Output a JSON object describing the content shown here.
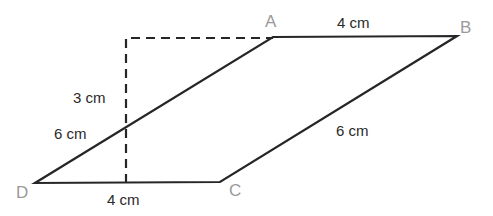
{
  "diagram": {
    "type": "parallelogram",
    "vertices": {
      "A": {
        "label": "A",
        "x": 273,
        "y": 37
      },
      "B": {
        "label": "B",
        "x": 457,
        "y": 36
      },
      "C": {
        "label": "C",
        "x": 220,
        "y": 182
      },
      "D": {
        "label": "D",
        "x": 35,
        "y": 183
      }
    },
    "labels": {
      "ab_length": "4 cm",
      "dc_length": "4 cm",
      "ad_length": "6 cm",
      "bc_length": "6 cm",
      "height": "3 cm"
    },
    "colors": {
      "line": "#262626",
      "vertex_label": "#9a9a9a",
      "text": "#2a2a2a"
    }
  }
}
